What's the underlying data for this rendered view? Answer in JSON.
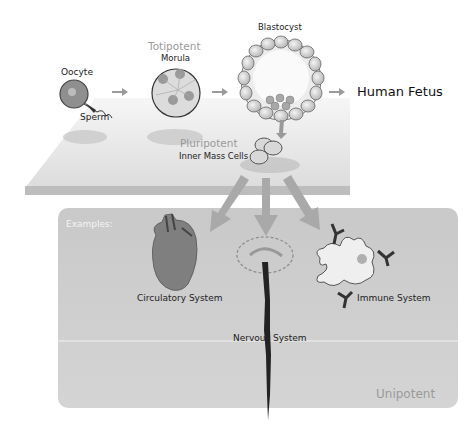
{
  "diagram": {
    "stages": {
      "oocyte": "Oocyte",
      "sperm": "Sperm",
      "totipotent": "Totipotent",
      "morula": "Morula",
      "blastocyst": "Blastocyst",
      "human_fetus": "Human Fetus",
      "pluripotent": "Pluripotent",
      "inner_mass": "Inner Mass Cells"
    },
    "examples": {
      "title": "Examples:",
      "circulatory": "Circulatory System",
      "nervous": "Nervous System",
      "immune": "Immune System",
      "unipotent": "Unipotent"
    },
    "colors": {
      "arrow": "#9a9a9a",
      "potency_label": "#9a9a9a",
      "panel": "#cfcfcf",
      "plane": "#e6e6e6"
    }
  }
}
